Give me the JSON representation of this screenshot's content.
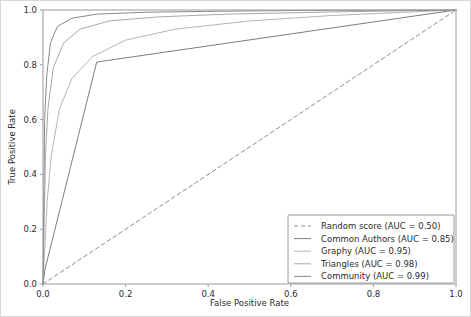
{
  "chart_data": {
    "type": "line",
    "title": "",
    "xlabel": "False Positive Rate",
    "ylabel": "True Positive Rate",
    "xlim": [
      0.0,
      1.0
    ],
    "ylim": [
      0.0,
      1.0
    ],
    "xticks": [
      "0.0",
      "0.2",
      "0.4",
      "0.6",
      "0.8",
      "1.0"
    ],
    "yticks": [
      "0.0",
      "0.2",
      "0.4",
      "0.6",
      "0.8",
      "1.0"
    ],
    "grid": false,
    "legend_position": "lower right",
    "series": [
      {
        "name": "Random score (AUC = 0.50)",
        "label": "Random score (AUC = 0.50)",
        "auc": 0.5,
        "style": "dashed",
        "color": "#8e8e8e",
        "x": [
          0.0,
          1.0
        ],
        "y": [
          0.0,
          1.0
        ]
      },
      {
        "name": "Common Authors (AUC = 0.85)",
        "label": "Common Authors (AUC = 0.85)",
        "auc": 0.85,
        "style": "solid",
        "color": "#7d7d7d",
        "x": [
          0.0,
          0.005,
          0.13,
          1.0
        ],
        "y": [
          0.0,
          0.055,
          0.81,
          1.0
        ]
      },
      {
        "name": "Graphy (AUC = 0.95)",
        "label": "Graphy (AUC = 0.95)",
        "auc": 0.95,
        "style": "solid",
        "color": "#b4b4b4",
        "x": [
          0.0,
          0.01,
          0.02,
          0.04,
          0.07,
          0.12,
          0.2,
          0.32,
          0.5,
          0.7,
          1.0
        ],
        "y": [
          0.0,
          0.3,
          0.47,
          0.64,
          0.75,
          0.83,
          0.89,
          0.93,
          0.96,
          0.98,
          1.0
        ]
      },
      {
        "name": "Triangles (AUC = 0.98)",
        "label": "Triangles (AUC = 0.98)",
        "auc": 0.98,
        "style": "solid",
        "color": "#a8a8a8",
        "x": [
          0.0,
          0.006,
          0.012,
          0.025,
          0.05,
          0.09,
          0.16,
          0.28,
          0.45,
          0.7,
          1.0
        ],
        "y": [
          0.0,
          0.47,
          0.64,
          0.79,
          0.88,
          0.93,
          0.96,
          0.975,
          0.985,
          0.993,
          1.0
        ]
      },
      {
        "name": "Community (AUC = 0.99)",
        "label": "Community (AUC = 0.99)",
        "auc": 0.99,
        "style": "solid",
        "color": "#8a8a8a",
        "x": [
          0.0,
          0.004,
          0.009,
          0.018,
          0.035,
          0.07,
          0.13,
          0.25,
          0.45,
          0.7,
          1.0
        ],
        "y": [
          0.0,
          0.6,
          0.76,
          0.88,
          0.94,
          0.97,
          0.985,
          0.992,
          0.996,
          0.999,
          1.0
        ]
      }
    ]
  }
}
